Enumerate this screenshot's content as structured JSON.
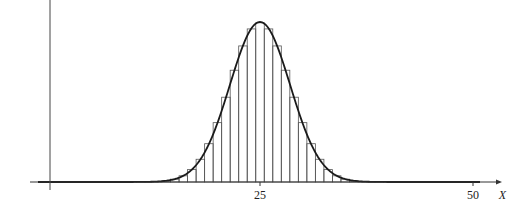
{
  "chart_data": {
    "type": "bar",
    "title": "",
    "xlabel": "X",
    "ylabel": "",
    "x_ticks": [
      {
        "value": 25,
        "label": "25"
      },
      {
        "value": 50,
        "label": "50"
      }
    ],
    "xlim": [
      0,
      51
    ],
    "n": 50,
    "p": 0.5,
    "normal_curve": {
      "mean": 25,
      "sd": 3.5355
    },
    "categories": [
      0,
      1,
      2,
      3,
      4,
      5,
      6,
      7,
      8,
      9,
      10,
      11,
      12,
      13,
      14,
      15,
      16,
      17,
      18,
      19,
      20,
      21,
      22,
      23,
      24,
      25,
      26,
      27,
      28,
      29,
      30,
      31,
      32,
      33,
      34,
      35,
      36,
      37,
      38,
      39,
      40,
      41,
      42,
      43,
      44,
      45,
      46,
      47,
      48,
      49,
      50
    ],
    "grid": false,
    "legend": null
  },
  "axis": {
    "x_label": "X",
    "tick_25": "25",
    "tick_50": "50"
  }
}
